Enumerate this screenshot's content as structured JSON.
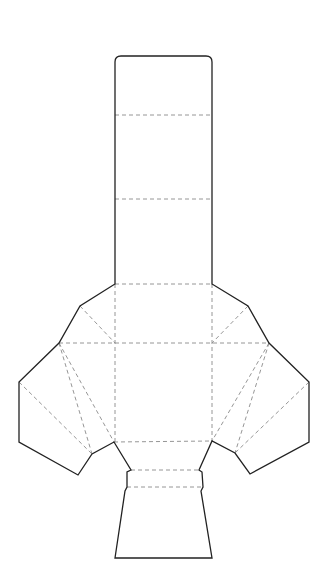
{
  "diagram": {
    "title": "",
    "type": "papercraft-net",
    "colors": {
      "background": "#ffffff",
      "cut_line": "#222222",
      "fold_line": "#8a8a8a"
    },
    "cut_outline": "M115,62 Q115,56 121,56 L206,56 Q212,56 212,62 L212,284 L248,306 L269,343 L309,382 L309,442 L250,474 L235,453 L212,441 L199,470 L202,472 L203,487 L201,491 L212,558 L115,558 L125,491 L127,487 L127,472 L131,470 L114,442 L92,454 L78,475 L19,442 L19,382 L59,343 L80,306 L115,284 Z",
    "fold_lines": [
      {
        "name": "column-fold-1",
        "x1": 115,
        "y1": 115,
        "x2": 212,
        "y2": 115
      },
      {
        "name": "column-fold-2",
        "x1": 115,
        "y1": 199,
        "x2": 212,
        "y2": 199
      },
      {
        "name": "column-fold-3",
        "x1": 115,
        "y1": 284,
        "x2": 212,
        "y2": 284
      },
      {
        "name": "body-fold-top",
        "x1": 59,
        "y1": 343,
        "x2": 269,
        "y2": 343
      },
      {
        "name": "body-fold-left-vertical",
        "x1": 115,
        "y1": 284,
        "x2": 115,
        "y2": 442
      },
      {
        "name": "body-fold-right-vertical",
        "x1": 212,
        "y1": 284,
        "x2": 212,
        "y2": 441
      },
      {
        "name": "body-fold-bottom",
        "x1": 114,
        "y1": 442,
        "x2": 212,
        "y2": 441
      },
      {
        "name": "upper-left-diagonal",
        "x1": 80,
        "y1": 306,
        "x2": 115,
        "y2": 343
      },
      {
        "name": "upper-right-diagonal",
        "x1": 248,
        "y1": 306,
        "x2": 212,
        "y2": 343
      },
      {
        "name": "left-wing-diagonal-1",
        "x1": 59,
        "y1": 343,
        "x2": 92,
        "y2": 454
      },
      {
        "name": "left-wing-diagonal-2",
        "x1": 59,
        "y1": 343,
        "x2": 114,
        "y2": 442
      },
      {
        "name": "left-wing-diagonal-3",
        "x1": 19,
        "y1": 382,
        "x2": 92,
        "y2": 454
      },
      {
        "name": "right-wing-diagonal-1",
        "x1": 269,
        "y1": 343,
        "x2": 235,
        "y2": 453
      },
      {
        "name": "right-wing-diagonal-2",
        "x1": 269,
        "y1": 343,
        "x2": 212,
        "y2": 441
      },
      {
        "name": "right-wing-diagonal-3",
        "x1": 309,
        "y1": 382,
        "x2": 235,
        "y2": 453
      },
      {
        "name": "neck-fold-top",
        "x1": 131,
        "y1": 470,
        "x2": 199,
        "y2": 470
      },
      {
        "name": "neck-fold-bottom",
        "x1": 127,
        "y1": 487,
        "x2": 203,
        "y2": 487
      }
    ]
  }
}
